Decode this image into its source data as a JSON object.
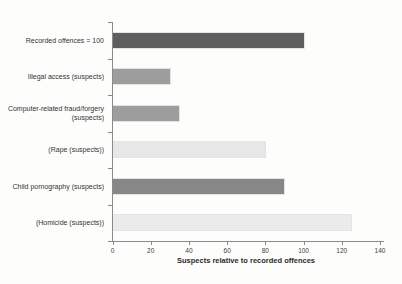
{
  "chart_data": {
    "type": "bar",
    "orientation": "horizontal",
    "title": "",
    "xlabel": "Suspects relative to recorded offences",
    "ylabel": "",
    "categories": [
      "Recorded offences = 100",
      "Illegal access (suspects)",
      "Computer-related fraud/forgery (suspects)",
      "(Rape (suspects))",
      "Child pornography (suspects)",
      "(Homicide (suspects))"
    ],
    "values": [
      100,
      30,
      35,
      80,
      90,
      125
    ],
    "bar_colors": [
      "#5e5e5e",
      "#9d9d9d",
      "#9d9d9d",
      "#e7e7e7",
      "#878787",
      "#ebebeb"
    ],
    "xlim": [
      0,
      140
    ],
    "xticks": [
      0,
      20,
      40,
      60,
      80,
      100,
      120,
      140
    ],
    "grid": false,
    "legend": null,
    "axis_color": "#8a8a8a"
  }
}
